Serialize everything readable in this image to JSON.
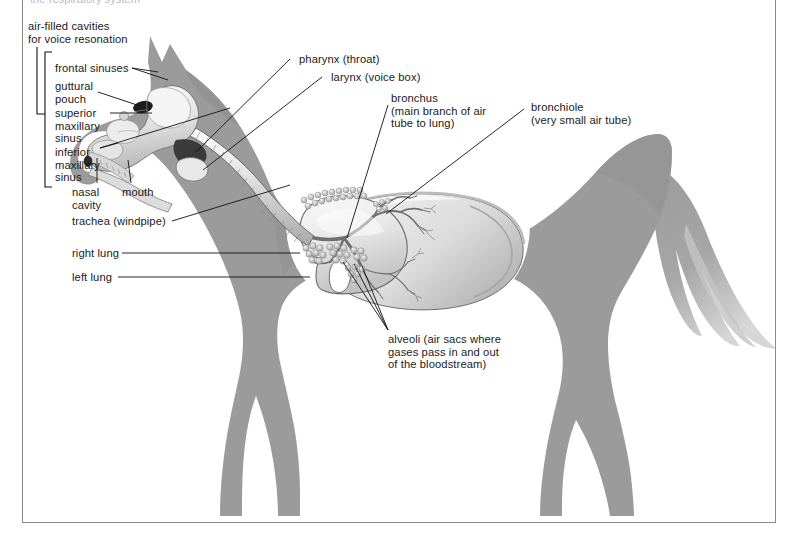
{
  "figure": {
    "clipped_header_text": "the respiratory system",
    "background_color": "#ffffff",
    "body_silhouette_color": "#9b9b9b",
    "body_shadow_color": "#8e8e8e",
    "organ_light_color": "#efefef",
    "organ_mid_color": "#c9c9c9",
    "organ_dark_color": "#6e6e6e",
    "line_color": "#111111",
    "rule_color": "#8a8a8a"
  },
  "labels": {
    "air_filled_cavities": "air-filled cavities\nfor voice resonation",
    "frontal_sinuses": "frontal sinuses",
    "guttural_pouch": "guttural\npouch",
    "superior_maxillary_sinus": "superior\nmaxillary\nsinus",
    "inferior_maxillary_sinus": "inferior\nmaxillary\nsinus",
    "nasal_cavity": "nasal\ncavity",
    "mouth": "mouth",
    "trachea": "trachea (windpipe)",
    "right_lung": "right lung",
    "left_lung": "left lung",
    "pharynx": "pharynx (throat)",
    "larynx": "larynx (voice box)",
    "bronchus": "bronchus\n(main branch of air\ntube to lung)",
    "bronchiole": "bronchiole\n(very small air tube)",
    "alveoli": "alveoli (air sacs where\ngases pass in and out\nof the bloodstream)"
  }
}
